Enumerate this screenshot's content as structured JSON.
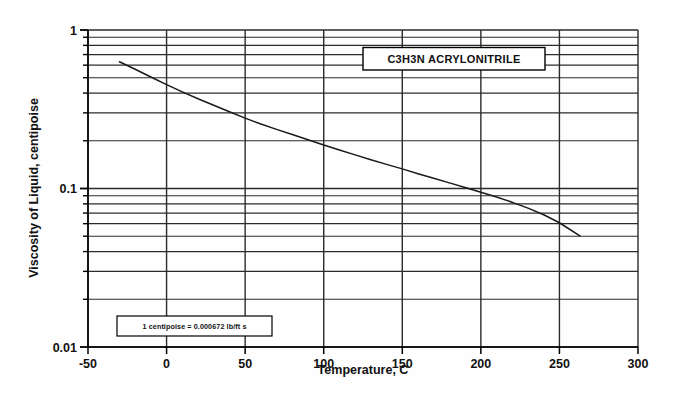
{
  "chart_data": {
    "type": "line",
    "title": "C3H3N  ACRYLONITRILE",
    "xlabel": "Temperature, C",
    "ylabel": "Viscosity of Liquid, centipoise",
    "xlim": [
      -50,
      300
    ],
    "ylim": [
      0.01,
      1
    ],
    "yscale": "log",
    "xscale": "linear",
    "grid": true,
    "legend": "none",
    "annotation": "1 centipoise = 0.000672 lb/ft s",
    "xticks": [
      "-50",
      "0",
      "50",
      "100",
      "150",
      "200",
      "250",
      "300"
    ],
    "xtick_values": [
      -50,
      0,
      50,
      100,
      150,
      200,
      250,
      300
    ],
    "yticks": [
      "0.01",
      "0.1",
      "1"
    ],
    "ytick_values": [
      0.01,
      0.1,
      1
    ],
    "yminor_values": [
      0.02,
      0.03,
      0.04,
      0.05,
      0.06,
      0.07,
      0.08,
      0.09,
      0.2,
      0.3,
      0.4,
      0.5,
      0.6,
      0.7,
      0.8,
      0.9
    ],
    "series": [
      {
        "name": "Acrylonitrile liquid viscosity",
        "x": [
          -30,
          -20,
          -10,
          0,
          10,
          20,
          30,
          40,
          50,
          60,
          70,
          80,
          90,
          100,
          110,
          120,
          130,
          140,
          150,
          160,
          170,
          180,
          190,
          200,
          210,
          220,
          230,
          240,
          250,
          263
        ],
        "y": [
          0.63,
          0.565,
          0.505,
          0.452,
          0.407,
          0.368,
          0.335,
          0.305,
          0.278,
          0.255,
          0.236,
          0.219,
          0.203,
          0.188,
          0.175,
          0.163,
          0.152,
          0.142,
          0.133,
          0.124,
          0.116,
          0.1085,
          0.1015,
          0.0948,
          0.0883,
          0.0818,
          0.0752,
          0.0683,
          0.0608,
          0.0502
        ]
      }
    ]
  },
  "chart": {
    "title_box": "C3H3N  ACRYLONITRILE",
    "note_box": "1 centipoise = 0.000672 lb/ft s",
    "x_axis_title": "Temperature, C",
    "y_axis_title": "Viscosity of Liquid, centipoise",
    "x_tick_labels": [
      "-50",
      "0",
      "50",
      "100",
      "150",
      "200",
      "250",
      "300"
    ],
    "y_tick_labels": [
      "1",
      "0.1",
      "0.01"
    ]
  },
  "colors": {
    "line": "#1a1a1a",
    "grid": "#2b2b2b",
    "axis": "#000000",
    "background": "#fefefe"
  }
}
